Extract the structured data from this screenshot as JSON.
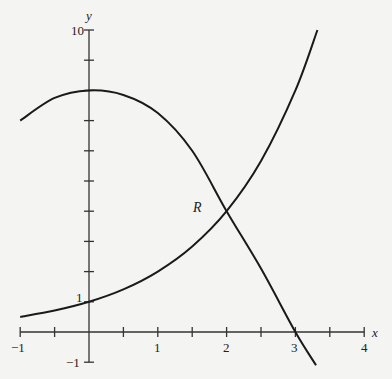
{
  "chart_data": {
    "type": "line",
    "title": "",
    "xlabel": "x",
    "ylabel": "y",
    "xlim": [
      -1,
      4
    ],
    "ylim": [
      -1,
      10
    ],
    "grid": false,
    "x_ticks": [
      -1,
      -0.5,
      0,
      0.5,
      1,
      1.5,
      2,
      2.5,
      3,
      3.5,
      4
    ],
    "x_tick_labels": [
      "-1",
      "1",
      "2",
      "3",
      "4"
    ],
    "y_ticks": [
      -1,
      1,
      2,
      3,
      4,
      5,
      6,
      7,
      8,
      9,
      10
    ],
    "y_tick_labels": [
      "-1",
      "1",
      "10"
    ],
    "annotations": [
      {
        "text": "R",
        "x": 1.6,
        "y": 4.2,
        "note": "region label near intersection point (2, 4)"
      }
    ],
    "series": [
      {
        "name": "exponential curve",
        "x": [
          -1,
          -0.5,
          0,
          0.5,
          1,
          1.5,
          2,
          2.5,
          3,
          3.32
        ],
        "y": [
          0.5,
          0.71,
          1,
          1.41,
          2,
          2.83,
          4,
          5.66,
          8,
          10
        ]
      },
      {
        "name": "concave-down curve",
        "x": [
          -1,
          -0.5,
          0,
          0.5,
          1,
          1.5,
          2,
          2.5,
          3,
          3.3
        ],
        "y": [
          7.0,
          7.75,
          8,
          7.85,
          7.25,
          6.0,
          4,
          2.1,
          0,
          -1.1
        ]
      }
    ]
  },
  "labels": {
    "x_axis": "x",
    "y_axis": "y",
    "region": "R",
    "x_neg1": "−1",
    "x_1": "1",
    "x_2": "2",
    "x_3": "3",
    "x_4": "4",
    "y_10": "10",
    "y_1": "1",
    "y_neg1": "−1"
  }
}
